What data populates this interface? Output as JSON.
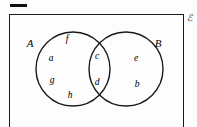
{
  "diagram": {
    "type": "venn-two-set",
    "universe": {
      "symbol": "ℰ",
      "name": "universal-set",
      "position": {
        "x": 189,
        "y": 18
      }
    },
    "corner_mark": {
      "name": "corner-dash",
      "label": ""
    },
    "sets": [
      {
        "id": "A",
        "label": "A",
        "label_position": {
          "x": 30,
          "y": 43
        },
        "circle": {
          "cx": 73,
          "cy": 69,
          "r": 37
        }
      },
      {
        "id": "B",
        "label": "B",
        "label_position": {
          "x": 158,
          "y": 43
        },
        "circle": {
          "cx": 126,
          "cy": 69,
          "r": 37
        }
      }
    ],
    "regions": [
      {
        "region": "A-only",
        "elements": [
          {
            "label": "f",
            "x": 67,
            "y": 40
          },
          {
            "label": "a",
            "x": 51,
            "y": 59
          },
          {
            "label": "g",
            "x": 52,
            "y": 81
          },
          {
            "label": "h",
            "x": 70,
            "y": 96
          }
        ]
      },
      {
        "region": "A-intersect-B",
        "elements": [
          {
            "label": "c",
            "x": 97,
            "y": 57
          },
          {
            "label": "d",
            "x": 97,
            "y": 83
          }
        ]
      },
      {
        "region": "B-only",
        "elements": [
          {
            "label": "e",
            "x": 136,
            "y": 59
          },
          {
            "label": "b",
            "x": 137,
            "y": 85
          }
        ]
      }
    ],
    "colors": {
      "stroke": "#1a1a1a",
      "text": "#1c1c1c",
      "background": "#fdfdfd"
    }
  }
}
